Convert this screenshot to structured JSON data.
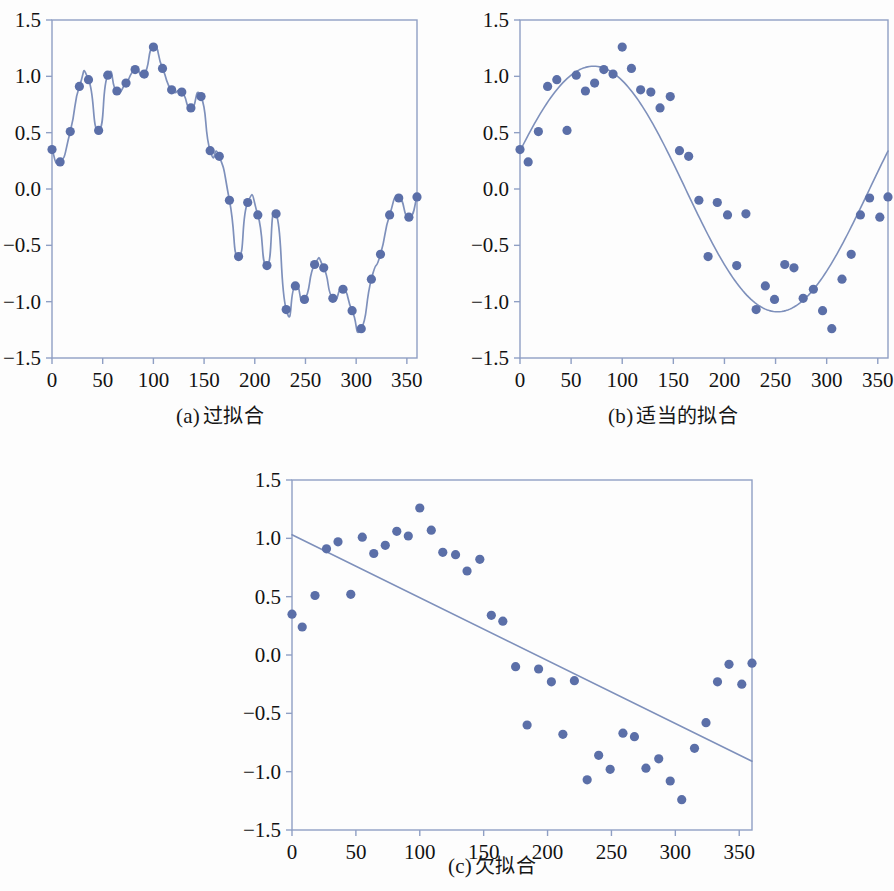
{
  "figure": {
    "title": "",
    "background_color": "#fdfdfd",
    "accent_color": "#5b6fa8",
    "axis_color": "#8f9fc4",
    "curve_color": "#7e90bb",
    "text_color": "#161616"
  },
  "panels": [
    {
      "id": "a",
      "label_latin": "(a)",
      "label_cjk": "过拟合",
      "caption": "(a) 过拟合"
    },
    {
      "id": "b",
      "label_latin": "(b)",
      "label_cjk": "适当的拟合",
      "caption": "(b) 适当的拟合"
    },
    {
      "id": "c",
      "label_latin": "(c)",
      "label_cjk": "欠拟合",
      "caption": "(c) 欠拟合"
    }
  ],
  "axes": {
    "xlim": [
      0,
      360
    ],
    "ylim": [
      -1.5,
      1.5
    ],
    "xticks": [
      0,
      50,
      100,
      150,
      200,
      250,
      300,
      350
    ],
    "xtick_labels": [
      "0",
      "50",
      "100",
      "150",
      "200",
      "250",
      "300",
      "350"
    ],
    "yticks": [
      -1.5,
      -1.0,
      -0.5,
      0.0,
      0.5,
      1.0,
      1.5
    ],
    "ytick_labels": [
      "−1.5",
      "−1.0",
      "−0.5",
      "0.0",
      "0.5",
      "1.0",
      "1.5"
    ],
    "grid": false,
    "xlabel": "",
    "ylabel": ""
  },
  "chart_data": [
    {
      "type": "scatter",
      "panel": "a",
      "title": "(a) 过拟合",
      "subtitle": "Overfitting: high-order interpolant passes through every sample",
      "xlabel": "",
      "ylabel": "",
      "xlim": [
        0,
        360
      ],
      "ylim": [
        -1.5,
        1.5
      ],
      "grid": false,
      "legend": "none",
      "scatter": {
        "name": "samples",
        "color": "#5b6fa8",
        "x": [
          0,
          8,
          18,
          27,
          36,
          46,
          55,
          64,
          73,
          82,
          91,
          100,
          109,
          118,
          128,
          137,
          147,
          156,
          165,
          175,
          184,
          193,
          203,
          212,
          221,
          231,
          240,
          249,
          259,
          268,
          277,
          287,
          296,
          305,
          315,
          324,
          333,
          342,
          352,
          360
        ],
        "y": [
          0.35,
          0.24,
          0.51,
          0.91,
          0.97,
          0.52,
          1.01,
          0.87,
          0.94,
          1.06,
          1.02,
          1.26,
          1.07,
          0.88,
          0.86,
          0.72,
          0.82,
          0.34,
          0.29,
          -0.1,
          -0.6,
          -0.12,
          -0.23,
          -0.68,
          -0.22,
          -1.07,
          -0.86,
          -0.98,
          -0.67,
          -0.7,
          -0.97,
          -0.89,
          -1.08,
          -1.24,
          -0.8,
          -0.58,
          -0.23,
          -0.08,
          -0.25,
          -0.07
        ]
      },
      "fit_curve": {
        "name": "overfit interpolating spline",
        "color": "#7e90bb",
        "description": "oscillating high-degree interpolant through all 40 points"
      }
    },
    {
      "type": "scatter",
      "panel": "b",
      "title": "(b) 适当的拟合",
      "subtitle": "Appropriate fit: smooth sinusoidal model",
      "xlabel": "",
      "ylabel": "",
      "xlim": [
        0,
        360
      ],
      "ylim": [
        -1.5,
        1.5
      ],
      "grid": false,
      "legend": "none",
      "scatter": {
        "name": "samples",
        "color": "#5b6fa8",
        "x": [
          0,
          8,
          18,
          27,
          36,
          46,
          55,
          64,
          73,
          82,
          91,
          100,
          109,
          118,
          128,
          137,
          147,
          156,
          165,
          175,
          184,
          193,
          203,
          212,
          221,
          231,
          240,
          249,
          259,
          268,
          277,
          287,
          296,
          305,
          315,
          324,
          333,
          342,
          352,
          360
        ],
        "y": [
          0.35,
          0.24,
          0.51,
          0.91,
          0.97,
          0.52,
          1.01,
          0.87,
          0.94,
          1.06,
          1.02,
          1.26,
          1.07,
          0.88,
          0.86,
          0.72,
          0.82,
          0.34,
          0.29,
          -0.1,
          -0.6,
          -0.12,
          -0.23,
          -0.68,
          -0.22,
          -1.07,
          -0.86,
          -0.98,
          -0.67,
          -0.7,
          -0.97,
          -0.89,
          -1.08,
          -1.24,
          -0.8,
          -0.58,
          -0.23,
          -0.08,
          -0.25,
          -0.07
        ]
      },
      "fit_curve": {
        "name": "sine fit",
        "color": "#7e90bb",
        "formula": "y = 1.09 * sin((x + 18) * pi / 180)",
        "amplitude": 1.09,
        "phase_deg": 18,
        "period_deg": 360,
        "y_at_x0": 0.18,
        "peak": {
          "x": 78,
          "y": 1.09
        },
        "trough": {
          "x": 278,
          "y": -0.99
        },
        "y_at_x360": 0.16
      }
    },
    {
      "type": "scatter",
      "panel": "c",
      "title": "(c) 欠拟合",
      "subtitle": "Underfitting: straight-line model cannot capture the curvature",
      "xlabel": "",
      "ylabel": "",
      "xlim": [
        0,
        360
      ],
      "ylim": [
        -1.5,
        1.5
      ],
      "grid": false,
      "legend": "none",
      "scatter": {
        "name": "samples",
        "color": "#5b6fa8",
        "x": [
          0,
          8,
          18,
          27,
          36,
          46,
          55,
          64,
          73,
          82,
          91,
          100,
          109,
          118,
          128,
          137,
          147,
          156,
          165,
          175,
          184,
          193,
          203,
          212,
          221,
          231,
          240,
          249,
          259,
          268,
          277,
          287,
          296,
          305,
          315,
          324,
          333,
          342,
          352,
          360
        ],
        "y": [
          0.35,
          0.24,
          0.51,
          0.91,
          0.97,
          0.52,
          1.01,
          0.87,
          0.94,
          1.06,
          1.02,
          1.26,
          1.07,
          0.88,
          0.86,
          0.72,
          0.82,
          0.34,
          0.29,
          -0.1,
          -0.6,
          -0.12,
          -0.23,
          -0.68,
          -0.22,
          -1.07,
          -0.86,
          -0.98,
          -0.67,
          -0.7,
          -0.97,
          -0.89,
          -1.08,
          -1.24,
          -0.8,
          -0.58,
          -0.23,
          -0.08,
          -0.25,
          -0.07
        ]
      },
      "fit_curve": {
        "name": "linear fit",
        "color": "#7e90bb",
        "formula": "y = 1.03 - 0.00539 * x",
        "intercept": 1.03,
        "slope": -0.00539,
        "y_at_x0": 1.03,
        "y_at_x360": -0.91
      }
    }
  ]
}
